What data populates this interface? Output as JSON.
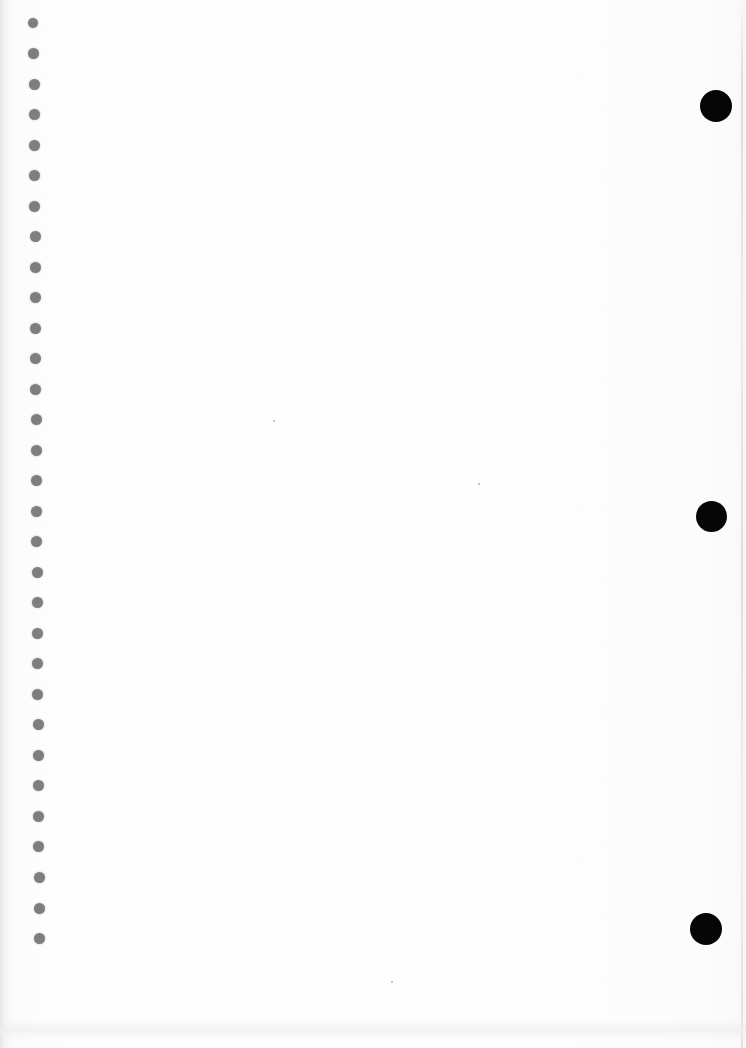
{
  "page": {
    "width": 746,
    "height": 1048,
    "background_color": "#fdfdfd",
    "content_text": ""
  },
  "binding": {
    "name": "spiral-binding-holes",
    "count": 31,
    "color": "#7e7e7e",
    "diameter": 11,
    "first_center_y": 23,
    "spacing_y": 30.5,
    "center_x": 35,
    "holes": [
      {
        "cx": 33,
        "cy": 23,
        "d": 10
      },
      {
        "cx": 33,
        "cy": 53,
        "d": 11
      },
      {
        "cx": 34,
        "cy": 84,
        "d": 11
      },
      {
        "cx": 34,
        "cy": 114,
        "d": 11
      },
      {
        "cx": 34,
        "cy": 145,
        "d": 11
      },
      {
        "cx": 34,
        "cy": 175,
        "d": 11
      },
      {
        "cx": 34,
        "cy": 206,
        "d": 11
      },
      {
        "cx": 35,
        "cy": 236,
        "d": 11
      },
      {
        "cx": 35,
        "cy": 267,
        "d": 11
      },
      {
        "cx": 35,
        "cy": 297,
        "d": 11
      },
      {
        "cx": 35,
        "cy": 328,
        "d": 11
      },
      {
        "cx": 35,
        "cy": 358,
        "d": 11
      },
      {
        "cx": 35,
        "cy": 389,
        "d": 11
      },
      {
        "cx": 36,
        "cy": 419,
        "d": 11
      },
      {
        "cx": 36,
        "cy": 450,
        "d": 11
      },
      {
        "cx": 36,
        "cy": 480,
        "d": 11
      },
      {
        "cx": 36,
        "cy": 511,
        "d": 11
      },
      {
        "cx": 36,
        "cy": 541,
        "d": 11
      },
      {
        "cx": 37,
        "cy": 572,
        "d": 11
      },
      {
        "cx": 37,
        "cy": 602,
        "d": 11
      },
      {
        "cx": 37,
        "cy": 633,
        "d": 11
      },
      {
        "cx": 37,
        "cy": 663,
        "d": 11
      },
      {
        "cx": 37,
        "cy": 694,
        "d": 11
      },
      {
        "cx": 38,
        "cy": 724,
        "d": 11
      },
      {
        "cx": 38,
        "cy": 755,
        "d": 11
      },
      {
        "cx": 38,
        "cy": 785,
        "d": 11
      },
      {
        "cx": 38,
        "cy": 816,
        "d": 11
      },
      {
        "cx": 38,
        "cy": 846,
        "d": 11
      },
      {
        "cx": 39,
        "cy": 877,
        "d": 11
      },
      {
        "cx": 39,
        "cy": 908,
        "d": 11
      },
      {
        "cx": 39,
        "cy": 938,
        "d": 11
      }
    ]
  },
  "marks": {
    "name": "black-circle-marks",
    "color": "#060606",
    "count": 3,
    "circles": [
      {
        "label": "mark-top",
        "cx": 716,
        "cy": 106,
        "d": 32
      },
      {
        "label": "mark-middle",
        "cx": 711,
        "cy": 516,
        "d": 31
      },
      {
        "label": "mark-bottom",
        "cx": 706,
        "cy": 929,
        "d": 32
      }
    ]
  },
  "artifacts": {
    "specks": [
      {
        "cx": 392,
        "cy": 982,
        "d": 2
      },
      {
        "cx": 479,
        "cy": 484,
        "d": 2
      },
      {
        "cx": 274,
        "cy": 421,
        "d": 2
      }
    ],
    "right_edge_streak": "#c8c8cb",
    "left_edge_shade": "#e4e4e6",
    "bottom_smudge": "#eeeef0"
  }
}
